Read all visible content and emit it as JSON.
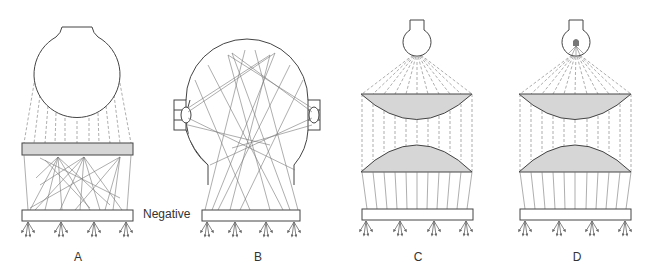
{
  "figure": {
    "panels": [
      {
        "id": "A",
        "label": "A",
        "description": "Large bulb above gray diffuser plate; scattered rays to negative"
      },
      {
        "id": "B",
        "label": "B",
        "description": "Reflective sphere with two side lamps; rays bouncing to negative"
      },
      {
        "id": "C",
        "label": "C",
        "description": "Small bulb with two condenser lenses focusing parallel rays to negative"
      },
      {
        "id": "D",
        "label": "D",
        "description": "Point-source bulb with two condenser lenses focusing parallel rays to negative"
      }
    ],
    "negative_label": "Negative",
    "colors": {
      "outline": "#444444",
      "fill_gray": "#d6d6d6",
      "ray": "#777777"
    }
  }
}
